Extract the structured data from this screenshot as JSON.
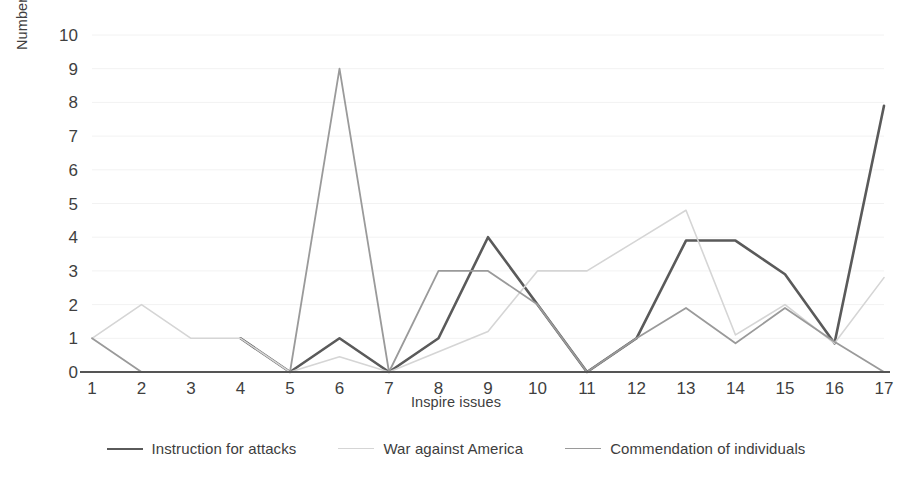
{
  "chart_data": {
    "type": "line",
    "title": "",
    "xlabel": "Inspire issues",
    "ylabel": "Number of articles per issue",
    "x": [
      1,
      2,
      3,
      4,
      5,
      6,
      7,
      8,
      9,
      10,
      11,
      12,
      13,
      14,
      15,
      16,
      17
    ],
    "xticklabels": [
      "1",
      "2",
      "3",
      "4",
      "5",
      "6",
      "7",
      "8",
      "9",
      "10",
      "11",
      "12",
      "13",
      "14",
      "15",
      "16",
      "17"
    ],
    "yticklabels": [
      "0",
      "1",
      "2",
      "3",
      "4",
      "5",
      "6",
      "7",
      "8",
      "9",
      "10"
    ],
    "ylim": [
      0,
      10
    ],
    "ytick_step": 1,
    "grid": "horizontal",
    "legend_position": "bottom",
    "series": [
      {
        "name": "Instruction for attacks",
        "color": "#5a5a5a",
        "width": 2.6,
        "x": [
          4,
          5,
          6,
          7,
          8,
          9,
          10,
          11,
          12,
          13,
          14,
          15,
          16,
          17
        ],
        "values": [
          1,
          0,
          1,
          0,
          1,
          4,
          2,
          0,
          1,
          3.9,
          3.9,
          2.9,
          0.85,
          7.9
        ]
      },
      {
        "name": "War against America",
        "color": "#d5d5d5",
        "width": 1.6,
        "x": [
          1,
          2,
          3,
          4,
          5,
          6,
          7,
          8,
          9,
          10,
          11,
          12,
          13,
          14,
          15,
          16,
          17
        ],
        "values": [
          1,
          2,
          1,
          1,
          0,
          0.45,
          0,
          0.6,
          1.2,
          3,
          3,
          3.9,
          4.8,
          1.1,
          2,
          0.85,
          2.8
        ]
      },
      {
        "name": "Commendation of individuals",
        "color": "#9a9a9a",
        "width": 1.8,
        "x": [
          1,
          2,
          3,
          4,
          5,
          6,
          7,
          8,
          9,
          10,
          11,
          12,
          13,
          14,
          15,
          16,
          17
        ],
        "values": [
          1,
          0,
          0,
          0,
          0,
          9,
          0,
          3,
          3,
          2,
          0,
          1,
          1.9,
          0.85,
          1.9,
          0.9,
          0
        ]
      }
    ]
  },
  "axes": {
    "x_axis_line_color": "#555555",
    "gridline_color": "#f2f2f2"
  }
}
